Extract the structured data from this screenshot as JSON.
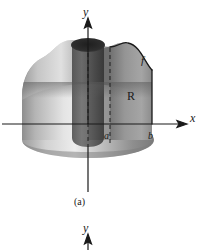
{
  "figure": {
    "caption": "(a)",
    "background_color": "#ffffff",
    "ink_color": "#1a1a1a"
  },
  "axes": {
    "y_top_label": "y",
    "y_bottom_label": "y",
    "x_label": "x",
    "origin": {
      "x": 88,
      "y": 124
    }
  },
  "labels": {
    "curve": "f",
    "region": "R",
    "inner_bound": "a",
    "outer_bound": "b"
  },
  "geometry": {
    "x_axis_y": 124,
    "y_axis_x": 88,
    "inner_radius_x": 110,
    "outer_radius_x": 152,
    "solid_left_x": 22,
    "solid_right_x": 152,
    "solid_top_y": 42,
    "solid_bottom_y": 152
  },
  "shading": {
    "highlight": "#f2f2f2",
    "light_gray": "#cfcfcf",
    "mid_gray": "#9a9a9a",
    "dark_gray": "#6a6a6a",
    "deep_shadow": "#2e2e2e",
    "hole_dark": "#262626"
  }
}
